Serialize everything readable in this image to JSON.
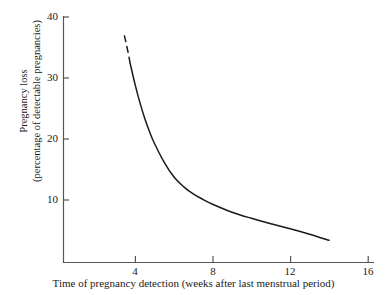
{
  "chart_data": {
    "type": "line",
    "title": "",
    "subtitle": "",
    "xlabel": "Time of pregnancy detection (weeks after last menstrual period)",
    "ylabel_line1": "Pregnancy loss",
    "ylabel_line2": "(percentage of detectable pregnancies)",
    "xlim": [
      2.5,
      16
    ],
    "ylim": [
      0,
      40
    ],
    "xticks": [
      4,
      8,
      12,
      16
    ],
    "xtick_labels": [
      "4",
      "8",
      "12",
      "16"
    ],
    "yticks": [
      10,
      20,
      30,
      40
    ],
    "ytick_labels": [
      "10",
      "20",
      "30",
      "40"
    ],
    "grid": false,
    "legend": false,
    "legend_position": "none",
    "line_color": "#1a1a1a",
    "axis_color": "#555555",
    "background_color": "#ffffff",
    "series": [
      {
        "name": "Pregnancy loss",
        "style": "dashed",
        "note": "extrapolated early segment",
        "x": [
          3.45,
          3.55,
          3.65,
          3.75
        ],
        "y": [
          37.0,
          35.6,
          34.1,
          32.4
        ]
      },
      {
        "name": "Pregnancy loss",
        "style": "solid",
        "note": "observed segment",
        "x": [
          3.75,
          4.0,
          4.25,
          4.5,
          4.75,
          5.0,
          5.5,
          6.0,
          6.5,
          7.0,
          7.5,
          8.0,
          9.0,
          10.0,
          11.0,
          12.0,
          13.0,
          14.0
        ],
        "y": [
          32.4,
          29.0,
          26.0,
          23.4,
          21.2,
          19.3,
          16.2,
          13.8,
          12.2,
          11.0,
          10.1,
          9.3,
          8.0,
          7.0,
          6.1,
          5.3,
          4.4,
          3.4
        ]
      }
    ]
  },
  "axis_tick_labels": {
    "y": [
      "40",
      "30",
      "20",
      "10"
    ],
    "x": [
      "4",
      "8",
      "12",
      "16"
    ]
  }
}
